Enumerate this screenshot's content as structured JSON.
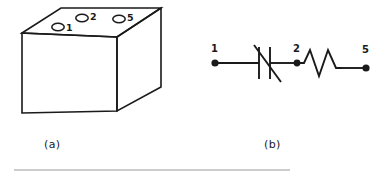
{
  "figure": {
    "background_color": "#ffffff",
    "ink_color": "#1a1a1a",
    "rule_color": "#999999",
    "panels": [
      {
        "id": "a",
        "caption": "(a)",
        "type": "isometric-box-drawing",
        "description": "rectangular box shown in isometric view with three holes on the top face",
        "holes": [
          {
            "label": "1"
          },
          {
            "label": "2"
          },
          {
            "label": "5"
          }
        ]
      },
      {
        "id": "b",
        "caption": "(b)",
        "type": "circuit-schematic",
        "description": "series circuit: terminal 1, variable capacitor, terminal 2, resistor, terminal 5",
        "terminals": [
          {
            "label": "1"
          },
          {
            "label": "2"
          },
          {
            "label": "5"
          }
        ],
        "components": [
          {
            "kind": "variable-capacitor",
            "between": [
              "1",
              "2"
            ]
          },
          {
            "kind": "resistor",
            "between": [
              "2",
              "5"
            ]
          }
        ]
      }
    ]
  },
  "panel_a": {
    "caption": "(a)",
    "hole_labels": {
      "h1": "1",
      "h2": "2",
      "h3": "5"
    }
  },
  "panel_b": {
    "caption": "(b)",
    "terminal_labels": {
      "t1": "1",
      "t2": "2",
      "t3": "5"
    }
  }
}
